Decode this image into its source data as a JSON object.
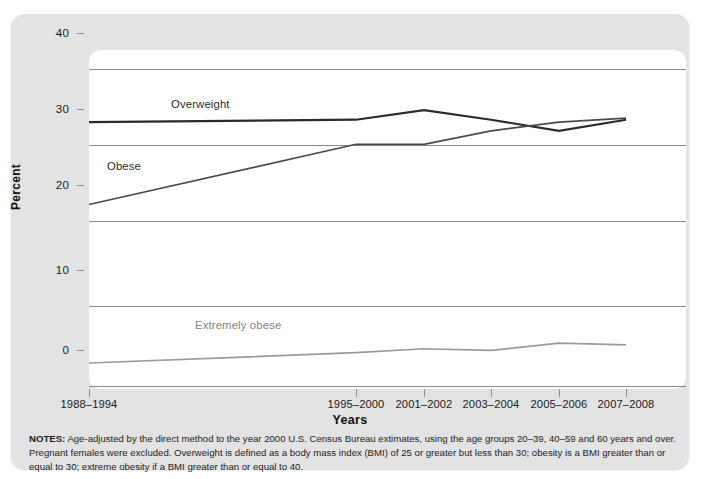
{
  "chart_data": {
    "type": "line",
    "title": "",
    "xlabel": "Years",
    "ylabel": "Percent",
    "ylim": [
      0,
      40
    ],
    "yticks": [
      0,
      10,
      20,
      30,
      40
    ],
    "grid": true,
    "legend_position": "inline-labels",
    "categories": [
      "1988–1994",
      "1995–2000",
      "2001–2002",
      "2003–2004",
      "2005–2006",
      "2007–2008"
    ],
    "series": [
      {
        "name": "Overweight",
        "color": "#2b2b2b",
        "values": [
          33.3,
          33.6,
          34.8,
          33.6,
          32.2,
          33.6
        ]
      },
      {
        "name": "Obese",
        "color": "#4a4a4a",
        "values": [
          22.9,
          30.5,
          30.5,
          32.2,
          33.3,
          33.8
        ]
      },
      {
        "name": "Extremely obese",
        "color": "#9a9a9a",
        "values": [
          2.9,
          4.2,
          4.7,
          4.5,
          5.4,
          5.2
        ]
      }
    ],
    "annotations": [
      {
        "text": "Overweight",
        "series": "Overweight"
      },
      {
        "text": "Obese",
        "series": "Obese"
      },
      {
        "text": "Extremely obese",
        "series": "Extremely obese"
      }
    ]
  },
  "axis": {
    "y_values": [
      "40",
      "30",
      "20",
      "10",
      "0"
    ],
    "y_title": "Percent",
    "x_title": "Years",
    "x_values": [
      "1988–1994",
      "1995–2000",
      "2001–2002",
      "2003–2004",
      "2005–2006",
      "2007–2008"
    ]
  },
  "labels": {
    "overweight": "Overweight",
    "obese": "Obese",
    "extremely_obese": "Extremely obese"
  },
  "notes": {
    "heading": "NOTES:",
    "body": " Age-adjusted by the direct method to the year 2000 U.S. Census Bureau extimates, using the age groups 20–39, 40–59 and 60 years and over. Pregnant females were excluded. Overweight is defined as a body mass index (BMI) of 25 or greater but less than 30; obesity is a BMI greater than or equal to 30; extreme obesity if a BMI greater than or equal to 40."
  },
  "colors": {
    "panel": "#e3e3e3",
    "plot_background": "#ffffff",
    "gridline": "#8c8c8c",
    "overweight": "#2b2b2b",
    "obese": "#4a4a4a",
    "extremely_obese": "#9a9a9a"
  }
}
